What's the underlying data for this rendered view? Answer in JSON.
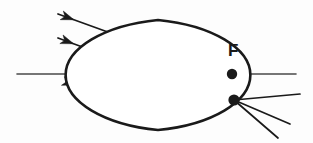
{
  "figure": {
    "kind": "optics-ray-diagram",
    "background_color": "#fdfdfd",
    "stroke_color": "#1a1a1a",
    "axis_color": "#4a4a4a",
    "width": 313,
    "height": 143
  },
  "labels": {
    "focal_point": "F"
  },
  "label_positions": {
    "focal_point": {
      "x": 228,
      "y": 42
    }
  },
  "optical_axis": {
    "name": "optical-axis",
    "x1": 17,
    "y1": 74,
    "x2": 296,
    "y2": 74,
    "stroke_width": 1.6
  },
  "lens": {
    "name": "biconvex-lens",
    "center_x": 158,
    "top_y": 20,
    "bottom_y": 130,
    "half_width": 14,
    "stroke_width": 2.6,
    "fill": "#ffffff"
  },
  "points": [
    {
      "name": "focal-point-dot",
      "label": "F",
      "x": 232,
      "y": 74,
      "r": 5.2,
      "on_axis": true
    },
    {
      "name": "image-convergence-dot",
      "label": "",
      "x": 234,
      "y": 100,
      "r": 5.6,
      "on_axis": false
    }
  ],
  "incident_rays": [
    {
      "name": "incident-ray-top",
      "x1": 58,
      "y1": 14,
      "x2": 152,
      "y2": 48,
      "arrow_at": 0.17
    },
    {
      "name": "incident-ray-middle",
      "x1": 58,
      "y1": 38,
      "x2": 150,
      "y2": 72,
      "arrow_at": 0.17
    },
    {
      "name": "incident-ray-bottom",
      "x1": 66,
      "y1": 82,
      "x2": 150,
      "y2": 110,
      "arrow_at": 0.11
    }
  ],
  "refracted_rays": [
    {
      "name": "refracted-ray-top",
      "x1": 166,
      "y1": 52,
      "x2": 234,
      "y2": 100,
      "arrow_at": 0.18
    },
    {
      "name": "refracted-ray-middle",
      "x1": 166,
      "y1": 76,
      "x2": 234,
      "y2": 100,
      "arrow_at": 0.22
    },
    {
      "name": "refracted-ray-bottom",
      "x1": 166,
      "y1": 106,
      "x2": 234,
      "y2": 100,
      "arrow_at": 0.16
    }
  ],
  "diverging_rays": [
    {
      "name": "diverging-ray-upper",
      "x1": 234,
      "y1": 100,
      "x2": 300,
      "y2": 94
    },
    {
      "name": "diverging-ray-middle",
      "x1": 234,
      "y1": 100,
      "x2": 290,
      "y2": 124
    },
    {
      "name": "diverging-ray-lower",
      "x1": 234,
      "y1": 100,
      "x2": 278,
      "y2": 138
    }
  ],
  "style": {
    "ray_stroke_width": 1.7,
    "arrow_length": 13,
    "arrow_half_width": 4.6,
    "arrow_notch": 3.4
  }
}
